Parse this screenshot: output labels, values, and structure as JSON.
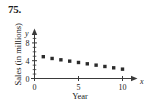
{
  "problem": {
    "number": "75."
  },
  "chart_data": {
    "type": "scatter",
    "title": "",
    "xlabel": "Year",
    "ylabel": "Sales (in millions)",
    "x_axis_letter": "x",
    "y_axis_letter": "y",
    "x": [
      1,
      2,
      3,
      4,
      5,
      6,
      7,
      8,
      9,
      10
    ],
    "values": [
      4.9,
      4.5,
      4.2,
      3.9,
      3.6,
      3.3,
      3.0,
      2.7,
      2.4,
      2.1
    ],
    "xlim": [
      0,
      11.5
    ],
    "ylim": [
      0,
      10.5
    ],
    "xticks": [
      0,
      5,
      10
    ],
    "xtick_labels": [
      "0",
      "5",
      "10"
    ],
    "yticks": [
      0,
      4,
      8
    ],
    "ytick_labels": [
      "0",
      "4",
      "8"
    ],
    "minor_yticks": [
      1,
      2,
      3,
      5,
      6,
      7,
      9,
      10
    ],
    "grid": false,
    "legend": null,
    "marker": "square",
    "marker_color": "#2b2b2b",
    "axis_color": "#3a3a3a"
  }
}
